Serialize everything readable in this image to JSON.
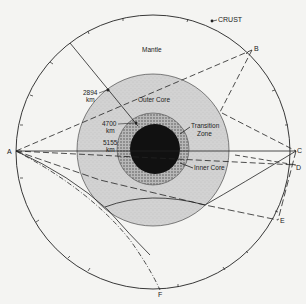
{
  "labels": {
    "crust": "CRUST",
    "mantle": "Mantle",
    "outer_core": "Outer Core",
    "transition_zone_1": "Transition",
    "transition_zone_2": "Zone",
    "inner_core": "Inner Core",
    "depth_1_value": "2894",
    "depth_1_unit": "km",
    "depth_2_value": "4700",
    "depth_2_unit": "km",
    "depth_3_value": "5155",
    "depth_3_unit": "km",
    "point_a": "A",
    "point_b": "B",
    "point_c": "C",
    "point_d": "D",
    "point_e": "E",
    "point_f": "F"
  },
  "colors": {
    "background": "#f4f4f2",
    "outer_core_fill": "#cfcfcf",
    "transition_fill": "#9a9a9a",
    "inner_core_fill": "#111111",
    "line": "#222222"
  }
}
